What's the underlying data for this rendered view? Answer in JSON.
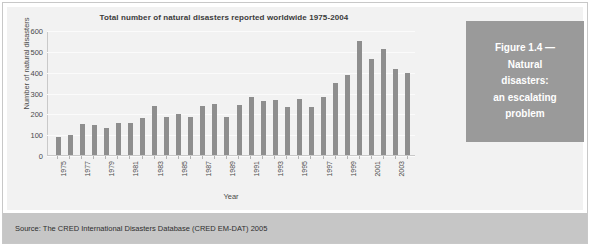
{
  "chart_data": {
    "type": "bar",
    "title": "Total number of natural disasters reported worldwide 1975-2004",
    "xlabel": "Year",
    "ylabel": "Number of natural disasters",
    "ylim": [
      0,
      600
    ],
    "yticks": [
      0,
      100,
      200,
      300,
      400,
      500,
      600
    ],
    "grid": true,
    "legend": null,
    "categories": [
      "1975",
      "1976",
      "1977",
      "1978",
      "1979",
      "1980",
      "1981",
      "1982",
      "1983",
      "1984",
      "1985",
      "1986",
      "1987",
      "1988",
      "1989",
      "1990",
      "1991",
      "1992",
      "1993",
      "1994",
      "1995",
      "1996",
      "1997",
      "1998",
      "1999",
      "2000",
      "2001",
      "2002",
      "2003",
      "2004"
    ],
    "visible_tick_labels": [
      "1975",
      "1977",
      "1979",
      "1981",
      "1983",
      "1985",
      "1987",
      "1989",
      "1991",
      "1993",
      "1995",
      "1997",
      "1999",
      "2001",
      "2003"
    ],
    "values": [
      85,
      95,
      150,
      147,
      132,
      155,
      157,
      180,
      235,
      183,
      197,
      182,
      238,
      248,
      183,
      241,
      283,
      259,
      268,
      233,
      271,
      233,
      283,
      348,
      388,
      550,
      465,
      515,
      415,
      395
    ],
    "bar_color": "#8e8e8e"
  },
  "caption": {
    "lines": [
      "Figure 1.4 —",
      "Natural",
      "disasters:",
      "an escalating",
      "problem"
    ],
    "box_color": "#9a9a9a",
    "text_color": "#ffffff"
  },
  "source": {
    "text": "Source: The CRED International Disasters Database (CRED EM-DAT) 2005",
    "band_color": "#c6c6c6"
  }
}
